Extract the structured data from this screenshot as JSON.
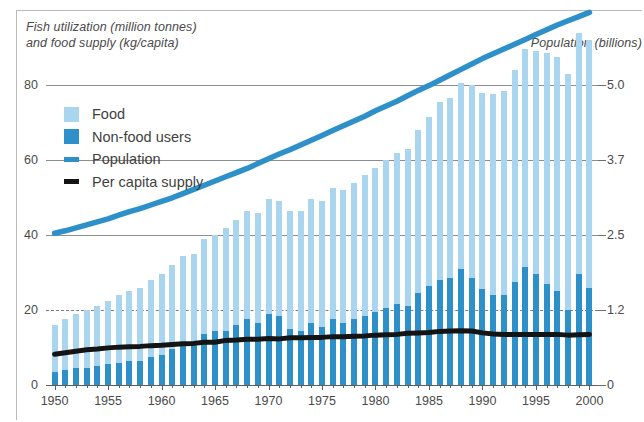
{
  "chart_data": {
    "type": "bar",
    "title": "",
    "ylabel": "Fish utilization (million tonnes) and food supply (kg/capita)",
    "ylabel_line1": "Fish utilization (million tonnes)",
    "ylabel_line2": "and food supply (kg/capita)",
    "y2label": "Population (billions)",
    "xlabel": "",
    "grid": true,
    "legend_position": "upper-left",
    "ylim": [
      0,
      80
    ],
    "yticks": [
      "0",
      "20",
      "40",
      "60",
      "80"
    ],
    "ytick_values": [
      0,
      20,
      40,
      60,
      80
    ],
    "y2lim": [
      0,
      5.0
    ],
    "y2ticks": [
      "0",
      "1.2",
      "2.5",
      "3.7",
      "5.0"
    ],
    "y2tick_values": [
      0,
      1.2,
      2.5,
      3.7,
      5.0
    ],
    "xticks": [
      "1950",
      "1955",
      "1960",
      "1965",
      "1970",
      "1975",
      "1980",
      "1985",
      "1990",
      "1995",
      "2000"
    ],
    "xtick_values": [
      1950,
      1955,
      1960,
      1965,
      1970,
      1975,
      1980,
      1985,
      1990,
      1995,
      2000
    ],
    "xlim": [
      1949.2,
      2000.8
    ],
    "colors": {
      "food": "#a9d5ef",
      "nonfood": "#2d90c9",
      "population": "#2d90c9",
      "per_capita": "#141414",
      "grid": "#8e8e8e",
      "axis": "#5e5e5e",
      "text": "#4a4a4a"
    },
    "legend": [
      {
        "label": "Food",
        "type": "swatch",
        "color": "#a9d5ef"
      },
      {
        "label": "Non-food users",
        "type": "swatch",
        "color": "#2d90c9"
      },
      {
        "label": "Population",
        "type": "line",
        "color": "#2d90c9"
      },
      {
        "label": "Per capita supply",
        "type": "line",
        "color": "#141414"
      }
    ],
    "x": [
      1950,
      1951,
      1952,
      1953,
      1954,
      1955,
      1956,
      1957,
      1958,
      1959,
      1960,
      1961,
      1962,
      1963,
      1964,
      1965,
      1966,
      1967,
      1968,
      1969,
      1970,
      1971,
      1972,
      1973,
      1974,
      1975,
      1976,
      1977,
      1978,
      1979,
      1980,
      1981,
      1982,
      1983,
      1984,
      1985,
      1986,
      1987,
      1988,
      1989,
      1990,
      1991,
      1992,
      1993,
      1994,
      1995,
      1996,
      1997,
      1998,
      1999,
      2000
    ],
    "series": [
      {
        "name": "Non-food users",
        "unit": "million tonnes",
        "axis": "left",
        "stack": "utilization",
        "color": "#2d90c9",
        "values": [
          3.5,
          4.0,
          4.5,
          4.5,
          5.0,
          5.5,
          6.0,
          6.5,
          6.5,
          7.5,
          8.0,
          9.5,
          11.0,
          11.0,
          13.5,
          14.5,
          14.5,
          16.0,
          17.5,
          16.5,
          19.0,
          18.5,
          15.0,
          14.5,
          16.5,
          15.5,
          17.5,
          16.5,
          17.5,
          18.5,
          19.5,
          20.5,
          21.5,
          21.0,
          24.5,
          26.5,
          28.0,
          28.5,
          31.0,
          28.5,
          25.5,
          24.0,
          24.0,
          27.5,
          31.5,
          29.5,
          27.0,
          25.0,
          20.0,
          29.5,
          26.0
        ]
      },
      {
        "name": "Food",
        "unit": "million tonnes",
        "axis": "left",
        "stack": "utilization",
        "color": "#a9d5ef",
        "values": [
          12.5,
          13.5,
          14.5,
          15.5,
          16.0,
          17.0,
          18.0,
          18.5,
          19.5,
          20.5,
          21.5,
          22.5,
          23.5,
          24.0,
          25.5,
          25.5,
          27.5,
          28.0,
          29.0,
          29.5,
          30.5,
          30.5,
          31.5,
          32.0,
          33.0,
          33.5,
          35.0,
          35.5,
          36.5,
          37.5,
          38.5,
          39.5,
          40.5,
          42.0,
          43.5,
          45.0,
          47.5,
          48.0,
          49.5,
          51.5,
          52.5,
          53.5,
          54.5,
          56.5,
          58.0,
          59.5,
          61.5,
          62.5,
          63.0,
          64.5,
          66.0
        ]
      },
      {
        "name": "Total utilization",
        "unit": "million tonnes",
        "axis": "left",
        "note": "food + non-food (bar total height)",
        "values": [
          16.0,
          17.5,
          19.0,
          20.0,
          21.0,
          22.5,
          24.0,
          25.0,
          26.0,
          28.0,
          29.5,
          32.0,
          34.5,
          35.0,
          39.0,
          40.0,
          42.0,
          44.0,
          46.5,
          46.0,
          49.5,
          49.0,
          46.5,
          46.5,
          49.5,
          49.0,
          52.5,
          52.0,
          54.0,
          56.0,
          58.0,
          60.0,
          62.0,
          63.0,
          68.0,
          71.5,
          75.5,
          76.5,
          80.5,
          80.0,
          78.0,
          77.5,
          78.5,
          84.0,
          89.5,
          89.0,
          88.5,
          87.5,
          83.0,
          94.0,
          92.0
        ]
      },
      {
        "name": "Population",
        "unit": "billions",
        "axis": "right",
        "type": "line",
        "color": "#2d90c9",
        "values": [
          2.53,
          2.57,
          2.62,
          2.67,
          2.72,
          2.77,
          2.83,
          2.89,
          2.94,
          3.0,
          3.06,
          3.12,
          3.19,
          3.26,
          3.33,
          3.4,
          3.47,
          3.54,
          3.61,
          3.69,
          3.77,
          3.85,
          3.92,
          4.0,
          4.08,
          4.16,
          4.24,
          4.32,
          4.4,
          4.48,
          4.57,
          4.65,
          4.73,
          4.82,
          4.91,
          4.99,
          5.08,
          5.17,
          5.26,
          5.35,
          5.44,
          5.52,
          5.6,
          5.68,
          5.76,
          5.84,
          5.92,
          6.0,
          6.07,
          6.14,
          6.21
        ]
      },
      {
        "name": "Per capita supply",
        "unit": "kg/capita",
        "axis": "left",
        "type": "line",
        "color": "#141414",
        "values": [
          8.2,
          8.6,
          9.0,
          9.4,
          9.6,
          9.9,
          10.1,
          10.2,
          10.3,
          10.5,
          10.6,
          10.8,
          11.0,
          11.1,
          11.4,
          11.4,
          11.9,
          12.0,
          12.2,
          12.2,
          12.4,
          12.3,
          12.6,
          12.6,
          12.7,
          12.7,
          12.9,
          12.9,
          13.0,
          13.1,
          13.3,
          13.4,
          13.5,
          13.8,
          13.9,
          14.0,
          14.3,
          14.4,
          14.5,
          14.4,
          13.9,
          13.6,
          13.5,
          13.5,
          13.5,
          13.5,
          13.5,
          13.5,
          13.3,
          13.4,
          13.5
        ]
      }
    ]
  },
  "figure": {
    "left_title_line1": "Fish utilization (million tonnes)",
    "left_title_line2": "and food supply (kg/capita)",
    "right_title": "Population (billions)"
  }
}
